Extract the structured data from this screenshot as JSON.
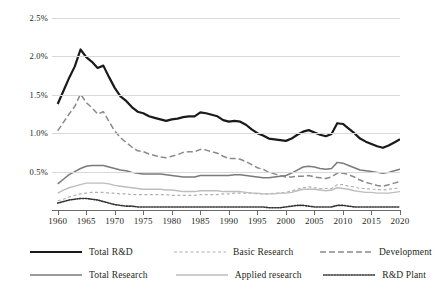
{
  "chart_data": {
    "type": "line",
    "title": "",
    "xlabel": "",
    "ylabel": "",
    "xlim": [
      1959,
      2020
    ],
    "ylim": [
      0,
      2.5
    ],
    "grid": true,
    "legend_position": "bottom",
    "y_ticks": [
      "0.5%",
      "1.0%",
      "1.5%",
      "2.0%",
      "2.5%"
    ],
    "y_tick_values": [
      0.5,
      1.0,
      1.5,
      2.0,
      2.5
    ],
    "x_ticks": [
      "1960",
      "1965",
      "1970",
      "1975",
      "1980",
      "1985",
      "1990",
      "1995",
      "2000",
      "2005",
      "2010",
      "2015",
      "2020"
    ],
    "x_tick_values": [
      1960,
      1965,
      1970,
      1975,
      1980,
      1985,
      1990,
      1995,
      2000,
      2005,
      2010,
      2015,
      2020
    ],
    "x": [
      1960,
      1961,
      1962,
      1963,
      1964,
      1965,
      1966,
      1967,
      1968,
      1969,
      1970,
      1971,
      1972,
      1973,
      1974,
      1975,
      1976,
      1977,
      1978,
      1979,
      1980,
      1981,
      1982,
      1983,
      1984,
      1985,
      1986,
      1987,
      1988,
      1989,
      1990,
      1991,
      1992,
      1993,
      1994,
      1995,
      1996,
      1997,
      1998,
      1999,
      2000,
      2001,
      2002,
      2003,
      2004,
      2005,
      2006,
      2007,
      2008,
      2009,
      2010,
      2011,
      2012,
      2013,
      2014,
      2015,
      2016,
      2017,
      2018,
      2019,
      2020
    ],
    "series": [
      {
        "name": "Total R&D",
        "style": "solid",
        "color": "#1a1a1a",
        "width": 2.2,
        "values": [
          1.38,
          1.55,
          1.72,
          1.87,
          2.09,
          1.99,
          1.93,
          1.85,
          1.88,
          1.73,
          1.59,
          1.48,
          1.42,
          1.34,
          1.28,
          1.26,
          1.22,
          1.2,
          1.18,
          1.16,
          1.18,
          1.19,
          1.21,
          1.22,
          1.22,
          1.27,
          1.26,
          1.24,
          1.22,
          1.17,
          1.15,
          1.16,
          1.15,
          1.11,
          1.05,
          1.0,
          0.97,
          0.93,
          0.92,
          0.91,
          0.9,
          0.93,
          0.98,
          1.02,
          1.04,
          1.01,
          0.98,
          0.96,
          0.99,
          1.13,
          1.12,
          1.06,
          1.0,
          0.93,
          0.89,
          0.86,
          0.83,
          0.81,
          0.84,
          0.88,
          0.92
        ]
      },
      {
        "name": "Total Research",
        "style": "solid",
        "color": "#7a7a7a",
        "width": 1.5,
        "values": [
          0.34,
          0.4,
          0.46,
          0.5,
          0.54,
          0.57,
          0.58,
          0.58,
          0.58,
          0.56,
          0.54,
          0.52,
          0.51,
          0.49,
          0.48,
          0.47,
          0.47,
          0.47,
          0.47,
          0.46,
          0.45,
          0.44,
          0.43,
          0.43,
          0.43,
          0.45,
          0.45,
          0.45,
          0.45,
          0.45,
          0.45,
          0.46,
          0.46,
          0.45,
          0.44,
          0.43,
          0.42,
          0.42,
          0.43,
          0.44,
          0.45,
          0.48,
          0.52,
          0.56,
          0.57,
          0.56,
          0.54,
          0.53,
          0.54,
          0.62,
          0.61,
          0.58,
          0.55,
          0.52,
          0.51,
          0.5,
          0.49,
          0.48,
          0.49,
          0.51,
          0.53
        ]
      },
      {
        "name": "Basic Research",
        "style": "dotted-light",
        "color": "#b0b0b0",
        "width": 1.2,
        "values": [
          0.12,
          0.14,
          0.17,
          0.19,
          0.21,
          0.22,
          0.23,
          0.23,
          0.23,
          0.22,
          0.22,
          0.21,
          0.21,
          0.2,
          0.2,
          0.2,
          0.2,
          0.2,
          0.2,
          0.2,
          0.19,
          0.19,
          0.19,
          0.19,
          0.19,
          0.2,
          0.2,
          0.2,
          0.2,
          0.21,
          0.21,
          0.22,
          0.22,
          0.22,
          0.22,
          0.21,
          0.21,
          0.21,
          0.22,
          0.22,
          0.23,
          0.25,
          0.27,
          0.29,
          0.3,
          0.29,
          0.28,
          0.28,
          0.28,
          0.33,
          0.33,
          0.31,
          0.3,
          0.28,
          0.28,
          0.27,
          0.27,
          0.26,
          0.27,
          0.28,
          0.29
        ]
      },
      {
        "name": "Applied research",
        "style": "solid",
        "color": "#bdbdbd",
        "width": 1.4,
        "values": [
          0.22,
          0.26,
          0.29,
          0.31,
          0.33,
          0.35,
          0.35,
          0.35,
          0.35,
          0.34,
          0.32,
          0.31,
          0.3,
          0.29,
          0.28,
          0.27,
          0.27,
          0.27,
          0.27,
          0.26,
          0.26,
          0.25,
          0.24,
          0.24,
          0.24,
          0.25,
          0.25,
          0.25,
          0.25,
          0.24,
          0.24,
          0.24,
          0.24,
          0.23,
          0.22,
          0.22,
          0.21,
          0.21,
          0.21,
          0.22,
          0.22,
          0.23,
          0.25,
          0.27,
          0.27,
          0.27,
          0.26,
          0.25,
          0.26,
          0.29,
          0.28,
          0.27,
          0.25,
          0.24,
          0.23,
          0.23,
          0.22,
          0.22,
          0.22,
          0.23,
          0.24
        ]
      },
      {
        "name": "Development",
        "style": "dashed",
        "color": "#8a8a8a",
        "width": 1.5,
        "values": [
          1.03,
          1.14,
          1.25,
          1.35,
          1.51,
          1.4,
          1.33,
          1.25,
          1.28,
          1.15,
          1.03,
          0.94,
          0.88,
          0.82,
          0.77,
          0.76,
          0.73,
          0.71,
          0.69,
          0.68,
          0.7,
          0.72,
          0.75,
          0.76,
          0.76,
          0.79,
          0.78,
          0.76,
          0.74,
          0.7,
          0.67,
          0.67,
          0.66,
          0.63,
          0.59,
          0.55,
          0.53,
          0.49,
          0.47,
          0.45,
          0.43,
          0.43,
          0.44,
          0.44,
          0.45,
          0.43,
          0.42,
          0.41,
          0.43,
          0.48,
          0.48,
          0.46,
          0.43,
          0.39,
          0.36,
          0.34,
          0.32,
          0.31,
          0.33,
          0.35,
          0.37
        ]
      },
      {
        "name": "R&D Plant",
        "style": "dotted-dense",
        "color": "#333333",
        "width": 1.6,
        "values": [
          0.09,
          0.11,
          0.13,
          0.14,
          0.15,
          0.15,
          0.14,
          0.13,
          0.11,
          0.09,
          0.07,
          0.06,
          0.05,
          0.05,
          0.04,
          0.04,
          0.04,
          0.04,
          0.04,
          0.04,
          0.04,
          0.04,
          0.04,
          0.04,
          0.04,
          0.04,
          0.04,
          0.04,
          0.04,
          0.04,
          0.04,
          0.04,
          0.04,
          0.04,
          0.04,
          0.04,
          0.04,
          0.03,
          0.03,
          0.03,
          0.04,
          0.05,
          0.06,
          0.06,
          0.05,
          0.04,
          0.04,
          0.04,
          0.04,
          0.06,
          0.06,
          0.05,
          0.04,
          0.04,
          0.04,
          0.04,
          0.04,
          0.04,
          0.04,
          0.04,
          0.04
        ]
      }
    ]
  },
  "legend": {
    "rows": [
      [
        {
          "label": "Total R&D",
          "key": "total-rd"
        },
        {
          "label": "Basic Research",
          "key": "basic-research"
        },
        {
          "label": "Development",
          "key": "development"
        }
      ],
      [
        {
          "label": "Total Research",
          "key": "total-research"
        },
        {
          "label": "Applied research",
          "key": "applied-research"
        },
        {
          "label": "R&D Plant",
          "key": "rd-plant"
        }
      ]
    ]
  }
}
